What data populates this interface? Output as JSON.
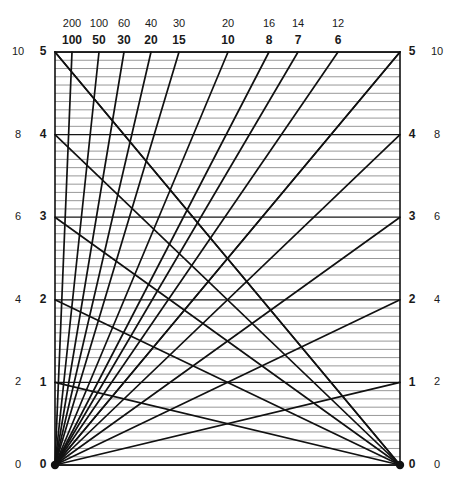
{
  "chart_data": {
    "type": "line",
    "title": "",
    "subtitle": "",
    "xlabel": "",
    "ylabel": "",
    "grid": true,
    "legend_position": "none",
    "plot_box": {
      "left": 55,
      "right": 400,
      "top": 52,
      "bottom": 465
    },
    "axes": {
      "left_inner": {
        "label": "inner-left-scale",
        "ticks": [
          0,
          1,
          2,
          3,
          4,
          5
        ],
        "tick_labels": [
          "0",
          "1",
          "2",
          "3",
          "4",
          "5"
        ],
        "range": [
          0,
          5
        ],
        "bold": true
      },
      "left_outer": {
        "label": "outer-left-scale",
        "ticks": [
          0,
          2,
          4,
          6,
          8,
          10
        ],
        "tick_labels": [
          "0",
          "2",
          "4",
          "6",
          "8",
          "10"
        ],
        "range": [
          0,
          10
        ],
        "bold": false
      },
      "right_inner": {
        "label": "inner-right-scale",
        "ticks": [
          0,
          1,
          2,
          3,
          4,
          5
        ],
        "tick_labels": [
          "0",
          "1",
          "2",
          "3",
          "4",
          "5"
        ],
        "range": [
          0,
          5
        ],
        "bold": true
      },
      "right_outer": {
        "label": "outer-right-scale",
        "ticks": [
          0,
          2,
          4,
          6,
          8,
          10
        ],
        "tick_labels": [
          "0",
          "2",
          "4",
          "6",
          "8",
          "10"
        ],
        "range": [
          0,
          10
        ],
        "bold": false
      }
    },
    "top_scale": {
      "upper_row_label": "upper-top-scale",
      "lower_row_label": "lower-top-scale",
      "entries": [
        {
          "upper": "200",
          "lower": "100",
          "x": 72
        },
        {
          "upper": "100",
          "lower": "50",
          "x": 99
        },
        {
          "upper": "60",
          "lower": "30",
          "x": 124
        },
        {
          "upper": "40",
          "lower": "20",
          "x": 151
        },
        {
          "upper": "30",
          "lower": "15",
          "x": 179
        },
        {
          "upper": "20",
          "lower": "10",
          "x": 228
        },
        {
          "upper": "16",
          "lower": "8",
          "x": 269
        },
        {
          "upper": "14",
          "lower": "7",
          "x": 298
        },
        {
          "upper": "12",
          "lower": "6",
          "x": 338
        }
      ]
    },
    "gridlines": {
      "minor_step": 0.1,
      "major_step": 1.0,
      "minor_count": 50,
      "major_values": [
        0,
        1,
        2,
        3,
        4,
        5
      ]
    },
    "fan_from_bottom_left": {
      "origin": [
        0,
        0
      ],
      "description": "radial lines from lower-left corner to each labelled point on the top border",
      "targets_x": [
        72,
        99,
        124,
        151,
        179,
        228,
        269,
        298,
        338,
        400
      ]
    },
    "fan_from_bottom_right": {
      "origin": [
        5,
        0
      ],
      "description": "radial lines from lower-right corner to each integer point on the left axis",
      "targets_y": [
        1,
        2,
        3,
        4,
        5
      ]
    },
    "fan_from_top_left": {
      "origin": [
        0,
        5
      ],
      "description": "lines from left-axis integer points descending to the lower-right corner",
      "targets_y": [
        1,
        2,
        3,
        4,
        5
      ]
    },
    "rising_lines_to_right_axis": {
      "description": "lines from lower-left corner rising to each integer point on the right axis",
      "targets_y": [
        1,
        2,
        3,
        4,
        5
      ]
    }
  }
}
